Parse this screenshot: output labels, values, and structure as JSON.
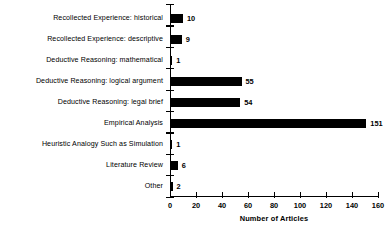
{
  "chart_data": {
    "type": "bar",
    "orientation": "horizontal",
    "title": "",
    "xlabel": "Number of Articles",
    "ylabel": "",
    "xlim": [
      0,
      160
    ],
    "xticks": [
      0,
      20,
      40,
      60,
      80,
      100,
      120,
      140,
      160
    ],
    "grid": false,
    "legend": null,
    "categories": [
      "Recollected Experience: historical",
      "Recollected Experience: descriptive",
      "Deductive Reasoning: mathematical",
      "Deductive Reasoning:  logical argument",
      "Deductive Reasoning:  legal brief",
      "Empirical Analysis",
      "Heuristic Analogy Such as Simulation",
      "Literature Review",
      "Other"
    ],
    "values": [
      10,
      9,
      1,
      55,
      54,
      151,
      1,
      6,
      2
    ],
    "value_labels": [
      "10",
      "9",
      "1",
      "55",
      "54",
      "151",
      "1",
      "6",
      "2"
    ],
    "bar_color": "#000000",
    "axis_color": "#000000"
  }
}
